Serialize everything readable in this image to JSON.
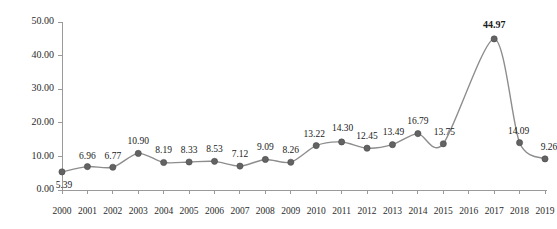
{
  "chart_data": {
    "type": "line",
    "title": "",
    "subtitle": "",
    "xlabel": "",
    "ylabel": "",
    "categories": [
      "2000",
      "2001",
      "2002",
      "2003",
      "2004",
      "2005",
      "2006",
      "2007",
      "2008",
      "2009",
      "2010",
      "2011",
      "2012",
      "2013",
      "2014",
      "2015",
      "2016",
      "2017",
      "2018",
      "2019"
    ],
    "values": [
      5.39,
      6.96,
      6.77,
      10.9,
      8.19,
      8.33,
      8.53,
      7.12,
      9.09,
      8.26,
      13.22,
      14.3,
      12.45,
      13.49,
      16.79,
      13.75,
      null,
      44.97,
      14.09,
      9.26
    ],
    "point_labels": [
      "5.39",
      "6.96",
      "6.77",
      "10.90",
      "8.19",
      "8.33",
      "8.53",
      "7.12",
      "9.09",
      "8.26",
      "13.22",
      "14.30",
      "12.45",
      "13.49",
      "16.79",
      "13.75",
      "",
      "44.97",
      "14.09",
      "9.26"
    ],
    "emphasized_labels": [
      "44.97"
    ],
    "unlabeled_categories": [
      "2016"
    ],
    "ylim": [
      0,
      50
    ],
    "ytick_values": [
      0,
      10,
      20,
      30,
      40,
      50
    ],
    "ytick_labels": [
      "0.00",
      "10.00",
      "20.00",
      "30.00",
      "40.00",
      "50.00"
    ],
    "xtick_labels": [
      "2000",
      "2001",
      "2002",
      "2003",
      "2004",
      "2005",
      "2006",
      "2007",
      "2008",
      "2009",
      "2010",
      "2011",
      "2012",
      "2013",
      "2014",
      "2015",
      "2016",
      "2017",
      "2018",
      "2019"
    ],
    "grid": false,
    "legend": null,
    "legend_position": "none",
    "series": [
      {
        "name": "",
        "values": [
          5.39,
          6.96,
          6.77,
          10.9,
          8.19,
          8.33,
          8.53,
          7.12,
          9.09,
          8.26,
          13.22,
          14.3,
          12.45,
          13.49,
          16.79,
          13.75,
          null,
          44.97,
          14.09,
          9.26
        ],
        "line_color": "#8d8d8d",
        "marker_color": "#636363",
        "marker_shape": "circle"
      }
    ],
    "max_value": 44.97,
    "max_category": "2017",
    "min_value": 5.39,
    "min_category": "2000"
  },
  "colors": {
    "background": "#ffffff",
    "axis": "#9a9a9a",
    "line": "#8d8d8d",
    "marker": "#636363",
    "text": "#1a1a1a"
  }
}
